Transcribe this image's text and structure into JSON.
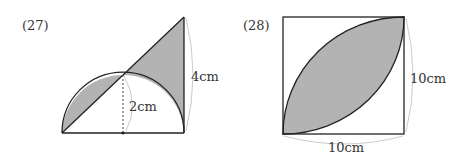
{
  "problems": [
    {
      "number": "(27)",
      "labels": {
        "height_label": "4cm",
        "radius_label": "2cm"
      },
      "description": "Semicircle with radius 2cm on a base; right triangle with height 4cm; shaded regions between diagonal and arcs"
    },
    {
      "number": "(28)",
      "labels": {
        "side_vertical": "10cm",
        "side_horizontal": "10cm"
      },
      "description": "Square of side 10cm with two quarter-circle arcs forming a shaded lens"
    }
  ],
  "colors": {
    "shade": "#b3b3b3",
    "stroke": "#222222",
    "dim": "#cccccc"
  }
}
